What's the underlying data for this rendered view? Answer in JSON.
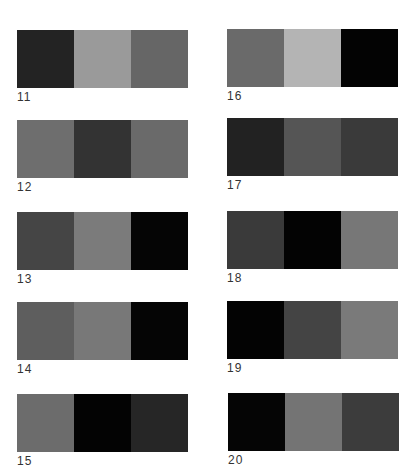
{
  "swatches": [
    {
      "id": "11",
      "label": "11",
      "colors": [
        "#232323",
        "#9a9a9a",
        "#666666"
      ]
    },
    {
      "id": "12",
      "label": "12",
      "colors": [
        "#6e6e6e",
        "#333333",
        "#6a6a6a"
      ]
    },
    {
      "id": "13",
      "label": "13",
      "colors": [
        "#454545",
        "#7b7b7b",
        "#050505"
      ]
    },
    {
      "id": "14",
      "label": "14",
      "colors": [
        "#5e5e5e",
        "#787878",
        "#050505"
      ]
    },
    {
      "id": "15",
      "label": "15",
      "colors": [
        "#6c6c6c",
        "#030303",
        "#262626"
      ]
    },
    {
      "id": "16",
      "label": "16",
      "colors": [
        "#6a6a6a",
        "#b4b4b4",
        "#030303"
      ]
    },
    {
      "id": "17",
      "label": "17",
      "colors": [
        "#222222",
        "#555555",
        "#3a3a3a"
      ]
    },
    {
      "id": "18",
      "label": "18",
      "colors": [
        "#3a3a3a",
        "#030303",
        "#777777"
      ]
    },
    {
      "id": "19",
      "label": "19",
      "colors": [
        "#030303",
        "#444444",
        "#7a7a7a"
      ]
    },
    {
      "id": "20",
      "label": "20",
      "colors": [
        "#050505",
        "#747474",
        "#3c3c3c"
      ]
    }
  ]
}
